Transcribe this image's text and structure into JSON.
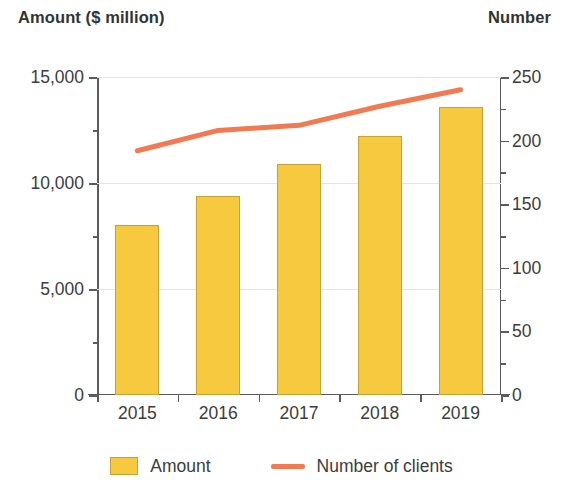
{
  "chart_data": {
    "type": "bar",
    "title": "",
    "categories": [
      "2015",
      "2016",
      "2017",
      "2018",
      "2019"
    ],
    "series": [
      {
        "name": "Amount",
        "type": "bar",
        "axis": "left",
        "color": "#F7C93F",
        "values": [
          8000,
          9400,
          10900,
          12200,
          13600
        ]
      },
      {
        "name": "Number of clients",
        "type": "line",
        "axis": "right",
        "color": "#F07A52",
        "values": [
          192,
          208,
          212,
          227,
          240
        ]
      }
    ],
    "xlabel": "",
    "ylabel": "Amount ($ million)",
    "y2label": "Number",
    "ylim": [
      0,
      15000
    ],
    "y2lim": [
      0,
      250
    ],
    "yticks": [
      0,
      5000,
      10000,
      15000
    ],
    "ytick_labels": [
      "0",
      "5,000",
      "10,000",
      "15,000"
    ],
    "y2ticks": [
      0,
      50,
      100,
      150,
      200,
      250
    ],
    "y2tick_labels": [
      "0",
      "50",
      "100",
      "150",
      "200",
      "250"
    ],
    "grid": true,
    "legend_position": "bottom"
  },
  "axes": {
    "left_title": "Amount ($ million)",
    "right_title": "Number"
  },
  "legend": {
    "items": [
      {
        "label": "Amount",
        "marker": "box-swatch-icon",
        "color": "#F7C93F"
      },
      {
        "label": "Number of clients",
        "marker": "line-swatch-icon",
        "color": "#F07A52"
      }
    ]
  }
}
